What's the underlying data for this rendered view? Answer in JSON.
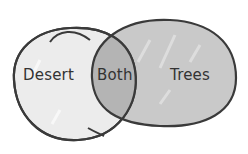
{
  "diagram": {
    "type": "venn",
    "sets": [
      {
        "id": "left",
        "label": "Desert",
        "fill": "#ececec"
      },
      {
        "id": "right",
        "label": "Trees",
        "fill": "#c9c9c9"
      }
    ],
    "intersection": {
      "label": "Both",
      "fill": "#b4b4b4"
    },
    "stroke": "#3a3a3a"
  }
}
